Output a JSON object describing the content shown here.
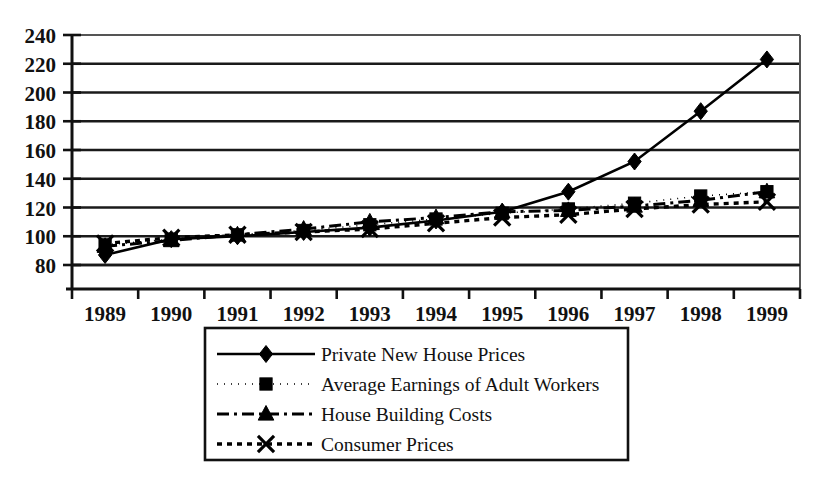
{
  "chart_data": {
    "type": "line",
    "title": "",
    "xlabel": "",
    "ylabel": "",
    "ylim": [
      80,
      240
    ],
    "ytick_step": 20,
    "grid": true,
    "legend_position": "bottom-center",
    "categories": [
      "1989",
      "1990",
      "1991",
      "1992",
      "1993",
      "1994",
      "1995",
      "1996",
      "1997",
      "1998",
      "1999"
    ],
    "yticks": [
      "240",
      "220",
      "200",
      "180",
      "160",
      "140",
      "120",
      "100",
      "80"
    ],
    "series": [
      {
        "name": "Private New House Prices",
        "marker": "diamond",
        "line_style": "solid",
        "values": [
          87,
          98,
          100,
          103,
          106,
          111,
          117,
          131,
          152,
          187,
          223
        ]
      },
      {
        "name": "Average Earnings of Adult Workers",
        "marker": "square",
        "line_style": "fine-dotted",
        "values": [
          94,
          98,
          101,
          104,
          108,
          112,
          116,
          119,
          123,
          128,
          131
        ]
      },
      {
        "name": "House Building Costs",
        "marker": "triangle",
        "line_style": "dash-dot",
        "values": [
          93,
          97,
          101,
          105,
          110,
          113,
          117,
          118,
          121,
          125,
          131
        ]
      },
      {
        "name": "Consumer Prices",
        "marker": "cross",
        "line_style": "dotted",
        "values": [
          95,
          99,
          101,
          103,
          105,
          109,
          113,
          115,
          119,
          122,
          124
        ]
      }
    ]
  },
  "legend": {
    "entries": [
      {
        "label": "Private New House Prices",
        "marker": "diamond-marker-icon"
      },
      {
        "label": "Average Earnings of Adult Workers",
        "marker": "square-marker-icon"
      },
      {
        "label": "House Building Costs",
        "marker": "triangle-marker-icon"
      },
      {
        "label": "Consumer Prices",
        "marker": "cross-marker-icon"
      }
    ]
  },
  "colors": {
    "series": "#000000",
    "grid": "#1a1a1a",
    "axis": "#111111",
    "background": "#ffffff"
  }
}
